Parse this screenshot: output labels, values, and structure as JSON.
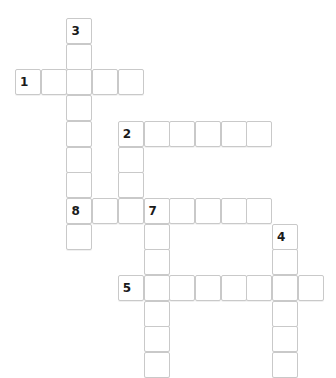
{
  "puzzle": {
    "type": "crossword-grid",
    "title": "Crossword puzzle grid",
    "cell_size": 25.7,
    "origin_x": 15,
    "origin_y": 18,
    "columns": 12,
    "rows": 14,
    "colors": {
      "background": "#ffffff",
      "cell_fill": "#ffffff",
      "cell_border": "#c9c9c9",
      "number_text": "#1a1a1a"
    },
    "entries": [
      {
        "number": "1",
        "direction": "across",
        "row": 2,
        "col": 0,
        "length": 5
      },
      {
        "number": "2",
        "direction": "across",
        "row": 4,
        "col": 4,
        "length": 6
      },
      {
        "number": "8",
        "direction": "across",
        "row": 7,
        "col": 2,
        "length": 3
      },
      {
        "number": "7",
        "direction": "across",
        "row": 7,
        "col": 5,
        "length": 5
      },
      {
        "number": "5",
        "direction": "across",
        "row": 10,
        "col": 4,
        "length": 8
      },
      {
        "number": "3",
        "direction": "down",
        "row": 0,
        "col": 2,
        "length": 9
      },
      {
        "number": "2",
        "direction": "down",
        "row": 4,
        "col": 4,
        "length": 4
      },
      {
        "number": "7",
        "direction": "down",
        "row": 7,
        "col": 5,
        "length": 7
      },
      {
        "number": "4",
        "direction": "down",
        "row": 8,
        "col": 10,
        "length": 6
      }
    ],
    "cells": [
      {
        "row": 0,
        "col": 2,
        "number": "3",
        "letter": ""
      },
      {
        "row": 1,
        "col": 2,
        "number": "",
        "letter": ""
      },
      {
        "row": 2,
        "col": 0,
        "number": "1",
        "letter": ""
      },
      {
        "row": 2,
        "col": 1,
        "number": "",
        "letter": ""
      },
      {
        "row": 2,
        "col": 2,
        "number": "",
        "letter": ""
      },
      {
        "row": 2,
        "col": 3,
        "number": "",
        "letter": ""
      },
      {
        "row": 2,
        "col": 4,
        "number": "",
        "letter": ""
      },
      {
        "row": 3,
        "col": 2,
        "number": "",
        "letter": ""
      },
      {
        "row": 4,
        "col": 2,
        "number": "",
        "letter": ""
      },
      {
        "row": 4,
        "col": 4,
        "number": "2",
        "letter": ""
      },
      {
        "row": 4,
        "col": 5,
        "number": "",
        "letter": ""
      },
      {
        "row": 4,
        "col": 6,
        "number": "",
        "letter": ""
      },
      {
        "row": 4,
        "col": 7,
        "number": "",
        "letter": ""
      },
      {
        "row": 4,
        "col": 8,
        "number": "",
        "letter": ""
      },
      {
        "row": 4,
        "col": 9,
        "number": "",
        "letter": ""
      },
      {
        "row": 5,
        "col": 2,
        "number": "",
        "letter": ""
      },
      {
        "row": 5,
        "col": 4,
        "number": "",
        "letter": ""
      },
      {
        "row": 6,
        "col": 2,
        "number": "",
        "letter": ""
      },
      {
        "row": 6,
        "col": 4,
        "number": "",
        "letter": ""
      },
      {
        "row": 7,
        "col": 2,
        "number": "8",
        "letter": ""
      },
      {
        "row": 7,
        "col": 3,
        "number": "",
        "letter": ""
      },
      {
        "row": 7,
        "col": 4,
        "number": "",
        "letter": ""
      },
      {
        "row": 7,
        "col": 5,
        "number": "7",
        "letter": ""
      },
      {
        "row": 7,
        "col": 6,
        "number": "",
        "letter": ""
      },
      {
        "row": 7,
        "col": 7,
        "number": "",
        "letter": ""
      },
      {
        "row": 7,
        "col": 8,
        "number": "",
        "letter": ""
      },
      {
        "row": 7,
        "col": 9,
        "number": "",
        "letter": ""
      },
      {
        "row": 8,
        "col": 2,
        "number": "",
        "letter": ""
      },
      {
        "row": 8,
        "col": 5,
        "number": "",
        "letter": ""
      },
      {
        "row": 8,
        "col": 10,
        "number": "4",
        "letter": ""
      },
      {
        "row": 9,
        "col": 5,
        "number": "",
        "letter": ""
      },
      {
        "row": 9,
        "col": 10,
        "number": "",
        "letter": ""
      },
      {
        "row": 10,
        "col": 4,
        "number": "5",
        "letter": ""
      },
      {
        "row": 10,
        "col": 5,
        "number": "",
        "letter": ""
      },
      {
        "row": 10,
        "col": 6,
        "number": "",
        "letter": ""
      },
      {
        "row": 10,
        "col": 7,
        "number": "",
        "letter": ""
      },
      {
        "row": 10,
        "col": 8,
        "number": "",
        "letter": ""
      },
      {
        "row": 10,
        "col": 9,
        "number": "",
        "letter": ""
      },
      {
        "row": 10,
        "col": 10,
        "number": "",
        "letter": ""
      },
      {
        "row": 10,
        "col": 11,
        "number": "",
        "letter": ""
      },
      {
        "row": 11,
        "col": 5,
        "number": "",
        "letter": ""
      },
      {
        "row": 11,
        "col": 10,
        "number": "",
        "letter": ""
      },
      {
        "row": 12,
        "col": 5,
        "number": "",
        "letter": ""
      },
      {
        "row": 12,
        "col": 10,
        "number": "",
        "letter": ""
      },
      {
        "row": 13,
        "col": 5,
        "number": "",
        "letter": ""
      },
      {
        "row": 13,
        "col": 10,
        "number": "",
        "letter": ""
      }
    ]
  }
}
